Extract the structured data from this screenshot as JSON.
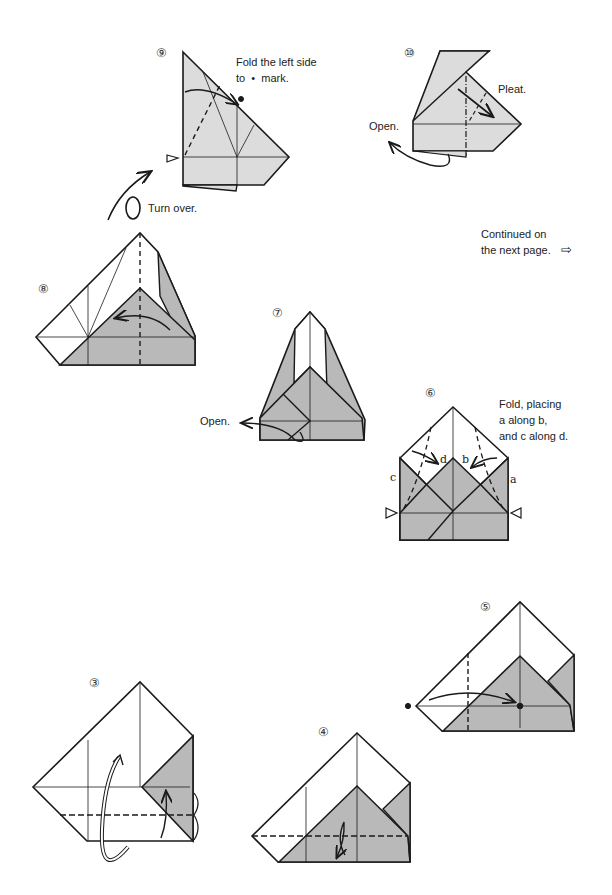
{
  "page": {
    "type": "origami-instructions",
    "continued_text": [
      "Continued on",
      "the next page."
    ],
    "continued_arrow": "⇨"
  },
  "colors": {
    "line": "#1a1a1a",
    "fill_dark": "#b9b9b9",
    "fill_light": "#dcdcdc",
    "paper": "#ffffff"
  },
  "steps": [
    {
      "id": "step-9",
      "number": "⑨",
      "instructions": [
        "Fold the left side",
        "to  •  mark."
      ],
      "extra": "Turn over."
    },
    {
      "id": "step-10",
      "number": "⑩",
      "instructions": [
        "Pleat."
      ],
      "extra": "Open."
    },
    {
      "id": "step-8",
      "number": "⑧",
      "instructions": []
    },
    {
      "id": "step-7",
      "number": "⑦",
      "instructions": [],
      "extra": "Open."
    },
    {
      "id": "step-6",
      "number": "⑥",
      "instructions": [
        "Fold, placing",
        "a along b,",
        "and c along d."
      ],
      "letters": [
        "a",
        "b",
        "c",
        "d"
      ]
    },
    {
      "id": "step-5",
      "number": "⑤",
      "instructions": []
    },
    {
      "id": "step-3",
      "number": "③",
      "instructions": []
    },
    {
      "id": "step-4",
      "number": "④",
      "instructions": []
    }
  ]
}
